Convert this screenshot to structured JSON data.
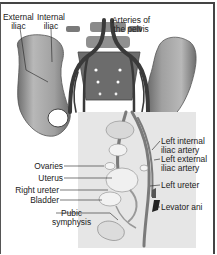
{
  "diagram": {
    "title": "Arteries of the pelvis",
    "top_labels": {
      "external_iliac": [
        "External",
        "iliac"
      ],
      "internal_iliac": [
        "Internal",
        "iliac"
      ],
      "arteries_of_pelvis": [
        "Arteries of",
        "the pelvis"
      ]
    },
    "left_labels": {
      "ovaries": "Ovaries",
      "uterus": "Uterus",
      "right_ureter": "Right ureter",
      "bladder": "Bladder",
      "pubic_symphysis": [
        "Pubic",
        "symphysis"
      ]
    },
    "right_labels": {
      "left_internal_iliac": [
        "Left internal",
        "iliac artery"
      ],
      "left_external_iliac": [
        "Left external",
        "iliac artery"
      ],
      "left_ureter": "Left ureter",
      "levator_ani": "Levator ani"
    },
    "colors": {
      "bone": "#9a9a9a",
      "bone_dark": "#5a5a5a",
      "artery": "#3a3a3a",
      "inset_bg": "#e6e6e6",
      "organ": "#f2f2f2",
      "muscle": "#222222"
    }
  }
}
